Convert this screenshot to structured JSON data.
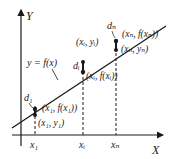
{
  "diagram": {
    "axes": {
      "x_label": "X",
      "y_label": "Y"
    },
    "curve_label": "y = f(x)",
    "x_ticks": [
      {
        "label": "x₁",
        "x": 35
      },
      {
        "label": "xᵢ",
        "x": 83
      },
      {
        "label": "xₙ",
        "x": 116
      }
    ],
    "points": [
      {
        "id": "1",
        "deviation_label": "d₁",
        "on_line_label": "(x₁, f(x₁))",
        "data_label": "(x₁, y₁)"
      },
      {
        "id": "i",
        "deviation_label": "dᵢ",
        "on_line_label": "(xᵢ, f(xᵢ))",
        "data_label": "(xᵢ, yᵢ)"
      },
      {
        "id": "n",
        "deviation_label": "dₙ",
        "on_line_label": "(xₙ, f(xₙ))",
        "data_label": "(xₙ, yₙ)"
      }
    ],
    "colors": {
      "ink": "#1a1a1a",
      "background": "#ffffff"
    }
  }
}
